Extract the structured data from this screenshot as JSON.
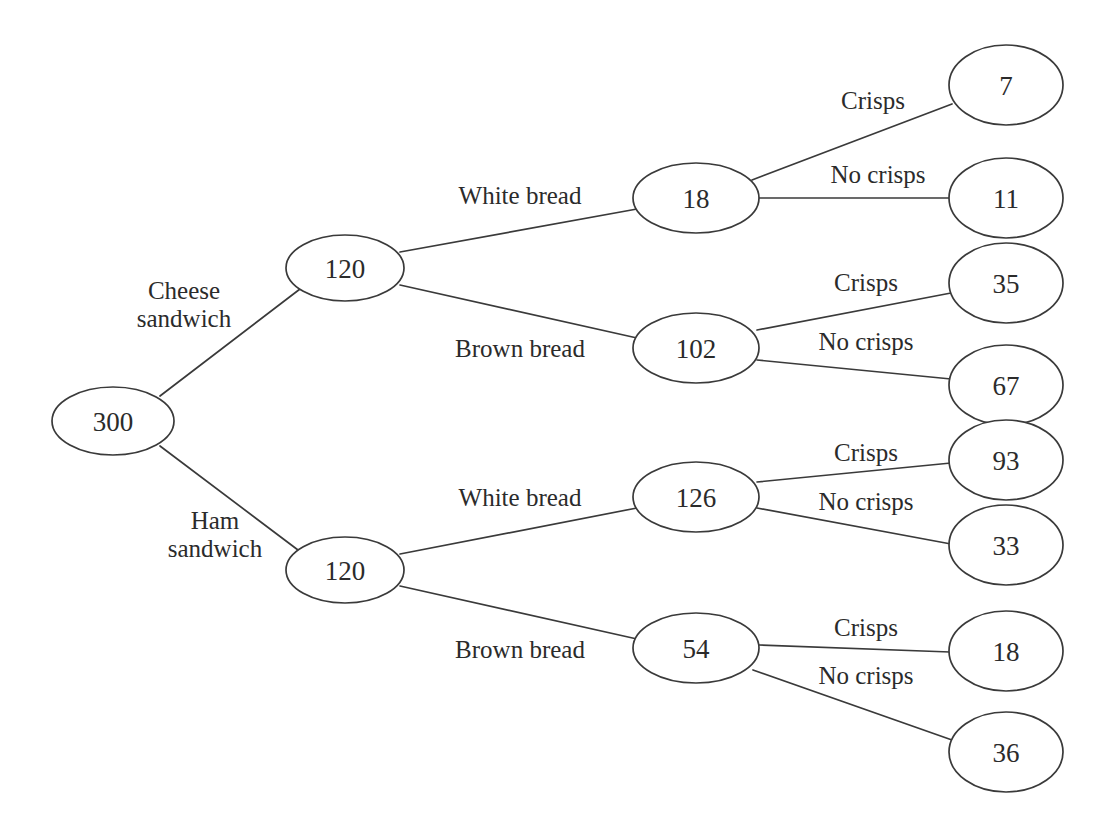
{
  "diagram": {
    "background_color": "#ffffff",
    "stroke_color": "#3a3a3a",
    "text_color": "#2b2b2b",
    "node_fill": "#ffffff"
  },
  "chart_data": {
    "type": "tree",
    "title": "",
    "root": "300",
    "levels": [
      "Sandwich type",
      "Bread type",
      "Crisps"
    ],
    "nodes": [
      {
        "id": "root",
        "value": "300",
        "cx": 113,
        "cy": 421,
        "rx": 61,
        "ry": 34,
        "level": 0
      },
      {
        "id": "cheese",
        "value": "120",
        "cx": 345,
        "cy": 268,
        "rx": 59,
        "ry": 33,
        "level": 1
      },
      {
        "id": "ham",
        "value": "120",
        "cx": 345,
        "cy": 570,
        "rx": 59,
        "ry": 33,
        "level": 1
      },
      {
        "id": "cheese-white",
        "value": "18",
        "cx": 696,
        "cy": 198,
        "rx": 63,
        "ry": 35,
        "level": 2
      },
      {
        "id": "cheese-brown",
        "value": "102",
        "cx": 696,
        "cy": 348,
        "rx": 63,
        "ry": 35,
        "level": 2
      },
      {
        "id": "ham-white",
        "value": "126",
        "cx": 696,
        "cy": 497,
        "rx": 63,
        "ry": 35,
        "level": 2
      },
      {
        "id": "ham-brown",
        "value": "54",
        "cx": 696,
        "cy": 648,
        "rx": 63,
        "ry": 35,
        "level": 2
      },
      {
        "id": "cw-crisps",
        "value": "7",
        "cx": 1006,
        "cy": 85,
        "rx": 57,
        "ry": 40,
        "level": 3
      },
      {
        "id": "cw-nocrisps",
        "value": "11",
        "cx": 1006,
        "cy": 198,
        "rx": 57,
        "ry": 40,
        "level": 3
      },
      {
        "id": "cb-crisps",
        "value": "35",
        "cx": 1006,
        "cy": 283,
        "rx": 57,
        "ry": 40,
        "level": 3
      },
      {
        "id": "cb-nocrisps",
        "value": "67",
        "cx": 1006,
        "cy": 385,
        "rx": 57,
        "ry": 40,
        "level": 3
      },
      {
        "id": "hw-crisps",
        "value": "93",
        "cx": 1006,
        "cy": 460,
        "rx": 57,
        "ry": 40,
        "level": 3
      },
      {
        "id": "hw-nocrisps",
        "value": "33",
        "cx": 1006,
        "cy": 545,
        "rx": 57,
        "ry": 40,
        "level": 3
      },
      {
        "id": "hb-crisps",
        "value": "18",
        "cx": 1006,
        "cy": 651,
        "rx": 57,
        "ry": 40,
        "level": 3
      },
      {
        "id": "hb-nocrisps",
        "value": "36",
        "cx": 1006,
        "cy": 752,
        "rx": 57,
        "ry": 40,
        "level": 3
      }
    ],
    "edges": [
      {
        "id": "e-root-cheese",
        "from": "root",
        "to": "cheese",
        "x1": 160,
        "y1": 396,
        "x2": 300,
        "y2": 289
      },
      {
        "id": "e-root-ham",
        "from": "root",
        "to": "ham",
        "x1": 160,
        "y1": 446,
        "x2": 298,
        "y2": 550
      },
      {
        "id": "e-cheese-white",
        "from": "cheese",
        "to": "cheese-white",
        "x1": 400,
        "y1": 252,
        "x2": 637,
        "y2": 209
      },
      {
        "id": "e-cheese-brown",
        "from": "cheese",
        "to": "cheese-brown",
        "x1": 400,
        "y1": 285,
        "x2": 637,
        "y2": 338
      },
      {
        "id": "e-ham-white",
        "from": "ham",
        "to": "ham-white",
        "x1": 400,
        "y1": 554,
        "x2": 637,
        "y2": 508
      },
      {
        "id": "e-ham-brown",
        "from": "ham",
        "to": "ham-brown",
        "x1": 400,
        "y1": 586,
        "x2": 637,
        "y2": 639
      },
      {
        "id": "e-cw-crisps",
        "from": "cheese-white",
        "to": "cw-crisps",
        "x1": 752,
        "y1": 180,
        "x2": 952,
        "y2": 104
      },
      {
        "id": "e-cw-nocrisps",
        "from": "cheese-white",
        "to": "cw-nocrisps",
        "x1": 759,
        "y1": 198,
        "x2": 949,
        "y2": 198
      },
      {
        "id": "e-cb-crisps",
        "from": "cheese-brown",
        "to": "cb-crisps",
        "x1": 757,
        "y1": 330,
        "x2": 951,
        "y2": 293
      },
      {
        "id": "e-cb-nocrisps",
        "from": "cheese-brown",
        "to": "cb-nocrisps",
        "x1": 757,
        "y1": 360,
        "x2": 951,
        "y2": 379
      },
      {
        "id": "e-hw-crisps",
        "from": "ham-white",
        "to": "hw-crisps",
        "x1": 757,
        "y1": 482,
        "x2": 951,
        "y2": 463
      },
      {
        "id": "e-hw-nocrisps",
        "from": "ham-white",
        "to": "hw-nocrisps",
        "x1": 757,
        "y1": 508,
        "x2": 951,
        "y2": 544
      },
      {
        "id": "e-hb-crisps",
        "from": "ham-brown",
        "to": "hb-crisps",
        "x1": 759,
        "y1": 645,
        "x2": 950,
        "y2": 652
      },
      {
        "id": "e-hb-nocrisps",
        "from": "ham-brown",
        "to": "hb-nocrisps",
        "x1": 753,
        "y1": 670,
        "x2": 952,
        "y2": 740
      }
    ],
    "edge_labels": [
      {
        "id": "lbl-cheese",
        "edge": "e-root-cheese",
        "lines": [
          "Cheese",
          "sandwich"
        ],
        "x": 184,
        "y": 304
      },
      {
        "id": "lbl-ham",
        "edge": "e-root-ham",
        "lines": [
          "Ham",
          "sandwich"
        ],
        "x": 215,
        "y": 534
      },
      {
        "id": "lbl-cw-bread",
        "edge": "e-cheese-white",
        "lines": [
          "White bread"
        ],
        "x": 520,
        "y": 195
      },
      {
        "id": "lbl-cb-bread",
        "edge": "e-cheese-brown",
        "lines": [
          "Brown bread"
        ],
        "x": 520,
        "y": 348
      },
      {
        "id": "lbl-hw-bread",
        "edge": "e-ham-white",
        "lines": [
          "White bread"
        ],
        "x": 520,
        "y": 497
      },
      {
        "id": "lbl-hb-bread",
        "edge": "e-ham-brown",
        "lines": [
          "Brown bread"
        ],
        "x": 520,
        "y": 649
      },
      {
        "id": "lbl-cw-crisps",
        "edge": "e-cw-crisps",
        "lines": [
          "Crisps"
        ],
        "x": 873,
        "y": 100
      },
      {
        "id": "lbl-cw-nocrisps",
        "edge": "e-cw-nocrisps",
        "lines": [
          "No crisps"
        ],
        "x": 878,
        "y": 174
      },
      {
        "id": "lbl-cb-crisps",
        "edge": "e-cb-crisps",
        "lines": [
          "Crisps"
        ],
        "x": 866,
        "y": 282
      },
      {
        "id": "lbl-cb-nocrisps",
        "edge": "e-cb-nocrisps",
        "lines": [
          "No crisps"
        ],
        "x": 866,
        "y": 341
      },
      {
        "id": "lbl-hw-crisps",
        "edge": "e-hw-crisps",
        "lines": [
          "Crisps"
        ],
        "x": 866,
        "y": 452
      },
      {
        "id": "lbl-hw-nocrisps",
        "edge": "e-hw-nocrisps",
        "lines": [
          "No crisps"
        ],
        "x": 866,
        "y": 501
      },
      {
        "id": "lbl-hb-crisps",
        "edge": "e-hb-crisps",
        "lines": [
          "Crisps"
        ],
        "x": 866,
        "y": 627
      },
      {
        "id": "lbl-hb-nocrisps",
        "edge": "e-hb-nocrisps",
        "lines": [
          "No crisps"
        ],
        "x": 866,
        "y": 675
      }
    ]
  }
}
